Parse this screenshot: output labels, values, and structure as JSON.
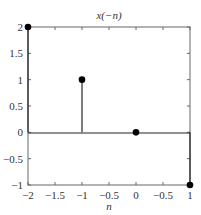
{
  "chart_data": {
    "type": "stem",
    "title": "x(−n)",
    "xlabel": "n",
    "ylabel": "",
    "xlim": [
      -2,
      1
    ],
    "ylim": [
      -1,
      2
    ],
    "grid": false,
    "x_ticks": [
      -2,
      -1.5,
      -1,
      -0.5,
      0,
      0.5,
      1
    ],
    "x_tick_labels": [
      "−2",
      "−1.5",
      "−1",
      "−0.5",
      "0",
      "−0.5",
      "1"
    ],
    "y_ticks": [
      2,
      1.5,
      1,
      0.5,
      0,
      -0.5,
      -1
    ],
    "y_tick_labels": [
      "2",
      "1.5",
      "1",
      "0.5",
      "0",
      "−0.5",
      "−1"
    ],
    "series": [
      {
        "name": "x(−n)",
        "x": [
          -2,
          -1,
          0,
          1
        ],
        "y": [
          2,
          1,
          0,
          -1
        ]
      }
    ],
    "colors": {
      "line": "#222222",
      "marker": "#000000",
      "axis": "#555555"
    }
  }
}
